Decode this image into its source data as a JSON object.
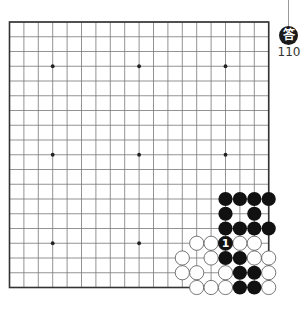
{
  "badge": {
    "label": "答",
    "number": "110"
  },
  "board": {
    "size": 19,
    "origin_x": 9.5,
    "origin_y": 22,
    "spacing_x": 14.4,
    "spacing_y": 14.75,
    "line_color": "#777777",
    "border_color": "#333333",
    "star_points": [
      [
        3,
        3
      ],
      [
        9,
        3
      ],
      [
        15,
        3
      ],
      [
        3,
        9
      ],
      [
        9,
        9
      ],
      [
        15,
        9
      ],
      [
        3,
        15
      ],
      [
        9,
        15
      ]
    ],
    "black_stones": [
      [
        15,
        12
      ],
      [
        16,
        12
      ],
      [
        17,
        12
      ],
      [
        18,
        12
      ],
      [
        15,
        13
      ],
      [
        17,
        13
      ],
      [
        15,
        14
      ],
      [
        16,
        14
      ],
      [
        17,
        14
      ],
      [
        18,
        14
      ],
      [
        15,
        16
      ],
      [
        16,
        16
      ],
      [
        16,
        17
      ],
      [
        17,
        17
      ],
      [
        16,
        18
      ],
      [
        17,
        18
      ]
    ],
    "white_stones": [
      [
        13,
        15
      ],
      [
        14,
        15
      ],
      [
        16,
        15
      ],
      [
        17,
        15
      ],
      [
        12,
        16
      ],
      [
        14,
        16
      ],
      [
        17,
        16
      ],
      [
        18,
        16
      ],
      [
        12,
        17
      ],
      [
        13,
        17
      ],
      [
        15,
        17
      ],
      [
        18,
        17
      ],
      [
        13,
        18
      ],
      [
        14,
        18
      ],
      [
        15,
        18
      ],
      [
        18,
        18
      ]
    ],
    "numbered_stones": [
      {
        "col": 15,
        "row": 15,
        "color": "black",
        "label": "1"
      }
    ]
  }
}
